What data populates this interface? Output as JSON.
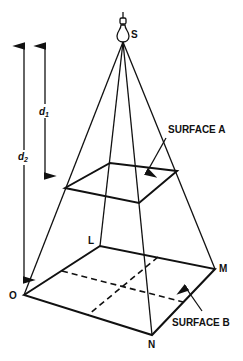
{
  "diagram": {
    "type": "inverse-square-law-pyramid",
    "source": {
      "label": "S",
      "icon": "light-bulb-icon"
    },
    "surfaces": [
      {
        "id": "A",
        "label": "SURFACE A"
      },
      {
        "id": "B",
        "label": "SURFACE B"
      }
    ],
    "vertices": {
      "O": "O",
      "L": "L",
      "M": "M",
      "N": "N"
    },
    "distances": [
      {
        "symbol": "d",
        "subscript": "1"
      },
      {
        "symbol": "d",
        "subscript": "2"
      }
    ],
    "colors": {
      "stroke": "#111111",
      "background": "#ffffff"
    }
  }
}
